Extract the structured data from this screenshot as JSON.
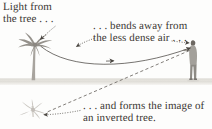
{
  "diagram": {
    "background_color": "#fdfdfc",
    "ink_color": "#3b3733",
    "ground_color": "#e3e1db",
    "tree_color": "#9b9792",
    "person_color": "#8f8c88"
  },
  "captions": {
    "light_from_tree": "Light from\nthe tree . . .",
    "bends_away": ". . . bends away from\nthe less dense air . . .",
    "forms_image": ". . . and forms the image of\nan inverted tree."
  },
  "elements": {
    "tree_label": "palm-tree",
    "person_label": "observer",
    "inverted_tree_label": "inverted-tree-image",
    "light_ray_label": "curved-light-ray",
    "sight_line_label": "dashed-line-of-sight",
    "ground_label": "ground-band"
  }
}
